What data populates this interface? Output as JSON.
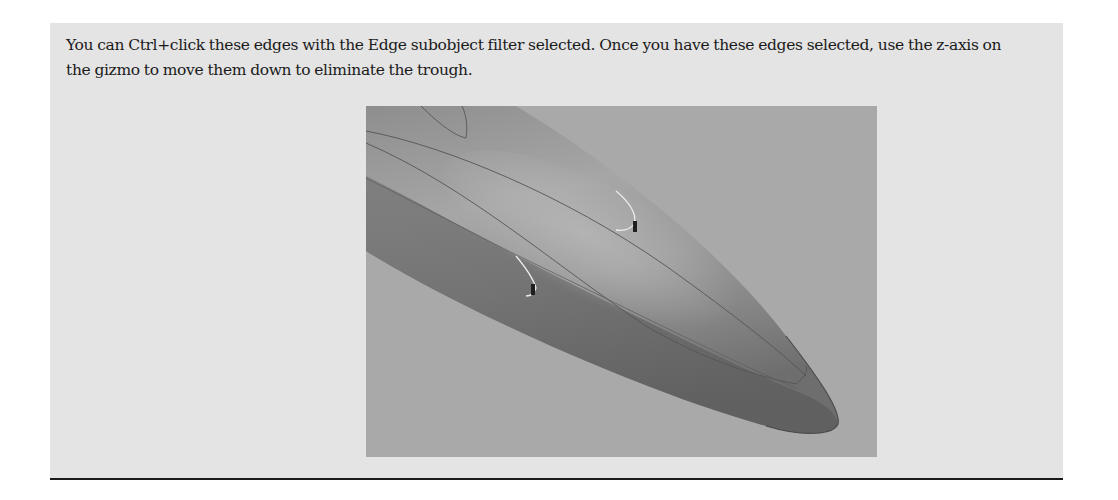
{
  "callout": {
    "paragraph": "You can Ctrl+click these edges with the Edge subobject filter selected. Once you have these edges selected, use the z-axis on the gizmo to move them down to eliminate the trough."
  },
  "figure": {
    "background_color": "#a9a9a9",
    "surface_color": "#9a9a9a",
    "edge_line_color": "#555555",
    "selected_edge_color": "#e8e8e8"
  }
}
